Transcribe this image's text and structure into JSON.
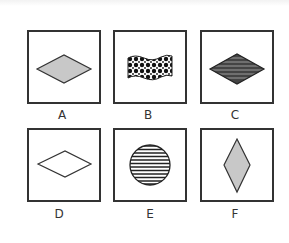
{
  "options": [
    {
      "label": "A",
      "shape": "horizontal-diamond",
      "fill": "gray",
      "fill_color": "#c8c8c8"
    },
    {
      "label": "B",
      "shape": "wavy-flag",
      "fill": "black-dot-pattern"
    },
    {
      "label": "C",
      "shape": "horizontal-diamond",
      "fill": "horizontal-stripes-dark"
    },
    {
      "label": "D",
      "shape": "horizontal-diamond",
      "fill": "none"
    },
    {
      "label": "E",
      "shape": "circle",
      "fill": "horizontal-stripes"
    },
    {
      "label": "F",
      "shape": "vertical-diamond",
      "fill": "gray",
      "fill_color": "#c8c8c8"
    }
  ],
  "colors": {
    "border": "#333333",
    "gray_fill": "#c8c8c8",
    "stroke": "#222222"
  }
}
